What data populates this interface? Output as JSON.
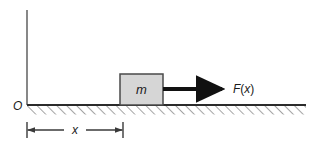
{
  "figure": {
    "kind": "physics-free-body-diagram",
    "colors": {
      "background": "#ffffff",
      "line": "#3a3a3a",
      "axis": "#6a6a6a",
      "ground_line": "#2b2b2b",
      "hatch": "#8d8d8d",
      "block_fill": "#d6d6d6",
      "block_stroke": "#4a4a4a",
      "arrow": "#111111",
      "text": "#1a1a1a"
    },
    "labels": {
      "origin": "O",
      "mass": "m",
      "force": "F(x)",
      "force_symbol": "F",
      "force_open_paren": "(",
      "force_argument": "x",
      "force_close_paren": ")",
      "displacement": "x"
    },
    "geometry": {
      "axis_x": 27,
      "axis_top_y": 10,
      "ground_y": 105,
      "ground_left_x": 27,
      "ground_right_x": 306,
      "hatch_depth": 9,
      "block_left_x": 120,
      "block_right_x": 163,
      "block_top_y": 74,
      "block_bottom_y": 105,
      "arrow_start_x": 163,
      "arrow_end_x": 228,
      "arrow_y": 89,
      "dim_line_y": 130,
      "dim_left_x": 27,
      "dim_right_x": 123
    }
  }
}
